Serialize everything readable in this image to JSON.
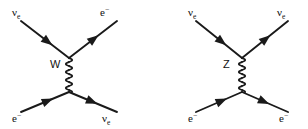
{
  "figure": {
    "background_color": "#ffffff",
    "line_color": "#1a1a1a",
    "width": 308,
    "height": 129
  },
  "diagrams": [
    {
      "id": "charged-current",
      "name": "W boson exchange",
      "propagator": {
        "label": "W",
        "style": "wavy",
        "label_x": 50,
        "label_y": 68,
        "x": 69,
        "y_top": 58,
        "y_bottom": 92
      },
      "vertices": [
        {
          "name": "top-vertex",
          "x": 69,
          "y": 58
        },
        {
          "name": "bottom-vertex",
          "x": 69,
          "y": 92
        }
      ],
      "legs": [
        {
          "name": "incoming-neutrino",
          "position": "top-left",
          "particle": "nu_e",
          "label_main": "ν",
          "label_sub": "e",
          "label_sup": "",
          "label_x": 12,
          "label_y": 16,
          "x1": 21,
          "y1": 21,
          "x2": 69,
          "y2": 58,
          "arrow_t": 0.56,
          "arrow_direction": "toward-vertex"
        },
        {
          "name": "outgoing-electron",
          "position": "top-right",
          "particle": "e_minus",
          "label_main": "e",
          "label_sub": "",
          "label_sup": "−",
          "label_x": 100,
          "label_y": 16,
          "x1": 69,
          "y1": 58,
          "x2": 117,
          "y2": 21,
          "arrow_t": 0.52,
          "arrow_direction": "away-from-vertex"
        },
        {
          "name": "incoming-electron",
          "position": "bottom-left",
          "particle": "e_minus",
          "label_main": "e",
          "label_sub": "",
          "label_sup": "−",
          "label_x": 12,
          "label_y": 122,
          "x1": 21,
          "y1": 112,
          "x2": 69,
          "y2": 92,
          "arrow_t": 0.56,
          "arrow_direction": "toward-vertex"
        },
        {
          "name": "outgoing-neutrino",
          "position": "bottom-right",
          "particle": "nu_e",
          "label_main": "ν",
          "label_sub": "e",
          "label_sup": "",
          "label_x": 102,
          "label_y": 122,
          "x1": 69,
          "y1": 92,
          "x2": 117,
          "y2": 112,
          "arrow_t": 0.48,
          "arrow_direction": "away-from-vertex"
        }
      ]
    },
    {
      "id": "neutral-current",
      "name": "Z boson exchange",
      "propagator": {
        "label": "Z",
        "style": "wavy",
        "label_x": 223,
        "label_y": 68,
        "x": 242,
        "y_top": 58,
        "y_bottom": 92
      },
      "vertices": [
        {
          "name": "top-vertex",
          "x": 242,
          "y": 58
        },
        {
          "name": "bottom-vertex",
          "x": 242,
          "y": 92
        }
      ],
      "legs": [
        {
          "name": "incoming-neutrino",
          "position": "top-left",
          "particle": "nu_e",
          "label_main": "ν",
          "label_sub": "e",
          "label_sup": "",
          "label_x": 188,
          "label_y": 16,
          "x1": 196,
          "y1": 21,
          "x2": 242,
          "y2": 58,
          "arrow_t": 0.56,
          "arrow_direction": "toward-vertex"
        },
        {
          "name": "outgoing-neutrino",
          "position": "top-right",
          "particle": "nu_e",
          "label_main": "ν",
          "label_sub": "e",
          "label_sup": "",
          "label_x": 277,
          "label_y": 16,
          "x1": 242,
          "y1": 58,
          "x2": 288,
          "y2": 21,
          "arrow_t": 0.52,
          "arrow_direction": "away-from-vertex"
        },
        {
          "name": "incoming-electron",
          "position": "bottom-left",
          "particle": "e_minus",
          "label_main": "e",
          "label_sub": "",
          "label_sup": "−",
          "label_x": 188,
          "label_y": 122,
          "x1": 196,
          "y1": 112,
          "x2": 242,
          "y2": 92,
          "arrow_t": 0.56,
          "arrow_direction": "toward-vertex"
        },
        {
          "name": "outgoing-electron",
          "position": "bottom-right",
          "particle": "e_minus",
          "label_main": "e",
          "label_sub": "",
          "label_sup": "−",
          "label_x": 279,
          "label_y": 122,
          "x1": 242,
          "y1": 92,
          "x2": 288,
          "y2": 112,
          "arrow_t": 0.48,
          "arrow_direction": "away-from-vertex"
        }
      ]
    }
  ]
}
